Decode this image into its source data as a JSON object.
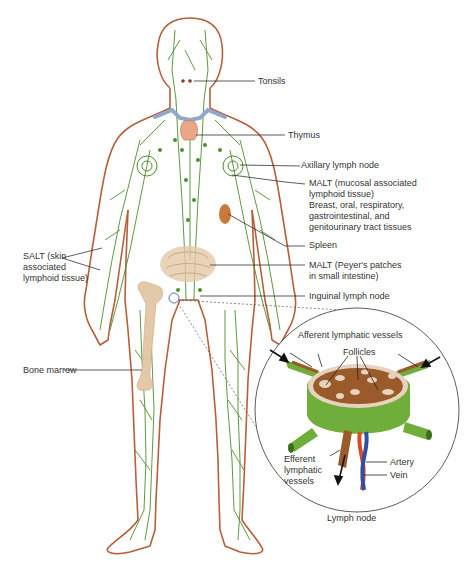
{
  "figure": {
    "colors": {
      "body_outline": "#b5603a",
      "lymph_vessels": "#4e8f2e",
      "bone": "#e3c9a8",
      "organ": "#e8a888",
      "spleen": "#c87a3a",
      "clavicle_vessels": "#8fa8cc",
      "artery": "#d94a2a",
      "vein": "#2f4f9f",
      "node_capsule": "#6fae3a",
      "node_medulla": "#9a5a2a",
      "node_cortex": "#e6d2bf",
      "leader_line": "#333333"
    }
  },
  "labels": {
    "tonsils": "Tonsils",
    "thymus": "Thymus",
    "axillary": "Axillary lymph node",
    "malt_mucosal_1": "MALT (mucosal associated",
    "malt_mucosal_2": "lymphoid tissue)",
    "malt_mucosal_3": "Breast, oral, respiratory,",
    "malt_mucosal_4": "gastrointestinal, and",
    "malt_mucosal_5": "genitourinary tract tissues",
    "spleen": "Spleen",
    "malt_peyer_1": "MALT (Peyer's patches",
    "malt_peyer_2": "in small intestine)",
    "inguinal": "Inguinal lymph node",
    "salt_1": "SALT (skin",
    "salt_2": "associated",
    "salt_3": "lymphoid tissue)",
    "bone_marrow": "Bone marrow"
  },
  "inset": {
    "title": "Lymph node",
    "afferent": "Afferent lymphatic vessels",
    "follicles": "Follicles",
    "efferent_1": "Efferent",
    "efferent_2": "lymphatic",
    "efferent_3": "vessels",
    "artery": "Artery",
    "vein": "Vein"
  }
}
